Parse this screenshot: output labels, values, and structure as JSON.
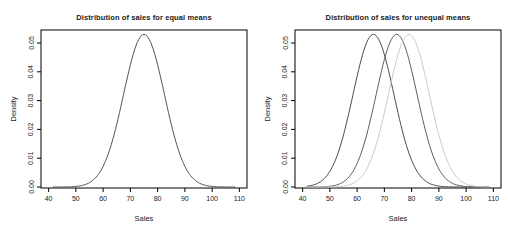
{
  "chart_data": [
    {
      "type": "line",
      "title": "Distribution of sales for equal means",
      "xlabel": "Sales",
      "ylabel": "Density",
      "xlim": [
        40,
        110
      ],
      "ylim": [
        0,
        0.055
      ],
      "grid": "off",
      "legend": "none",
      "xticks": [
        40,
        50,
        60,
        70,
        80,
        90,
        100,
        110
      ],
      "xtick_labels": [
        "40",
        "50",
        "60",
        "70",
        "80",
        "90",
        "100",
        "110"
      ],
      "yticks": [
        0,
        0.01,
        0.02,
        0.03,
        0.04,
        0.05
      ],
      "ytick_labels": [
        "0.00",
        "0.01",
        "0.02",
        "0.03",
        "0.04",
        "0.05"
      ],
      "series": [
        {
          "name": "sales-density",
          "distribution": "normal",
          "mean": 75,
          "sd": 7.5,
          "peak_density": 0.053,
          "color": "#545454"
        }
      ]
    },
    {
      "type": "line",
      "title": "Distribution of sales for unequal means",
      "xlabel": "Sales",
      "ylabel": "Density",
      "xlim": [
        40,
        110
      ],
      "ylim": [
        0,
        0.055
      ],
      "grid": "off",
      "legend": "none",
      "xticks": [
        40,
        50,
        60,
        70,
        80,
        90,
        100,
        110
      ],
      "xtick_labels": [
        "40",
        "50",
        "60",
        "70",
        "80",
        "90",
        "100",
        "110"
      ],
      "yticks": [
        0,
        0.01,
        0.02,
        0.03,
        0.04,
        0.05
      ],
      "ytick_labels": [
        "0.00",
        "0.01",
        "0.02",
        "0.03",
        "0.04",
        "0.05"
      ],
      "series": [
        {
          "name": "group-1-density",
          "distribution": "normal",
          "mean": 66,
          "sd": 7.5,
          "peak_density": 0.053,
          "color": "#4c4c4c"
        },
        {
          "name": "group-2-density",
          "distribution": "normal",
          "mean": 74.5,
          "sd": 7.5,
          "peak_density": 0.053,
          "color": "#5e5e5e"
        },
        {
          "name": "group-3-density",
          "distribution": "normal",
          "mean": 79,
          "sd": 7.5,
          "peak_density": 0.053,
          "color": "#c6cdc6"
        }
      ]
    }
  ]
}
